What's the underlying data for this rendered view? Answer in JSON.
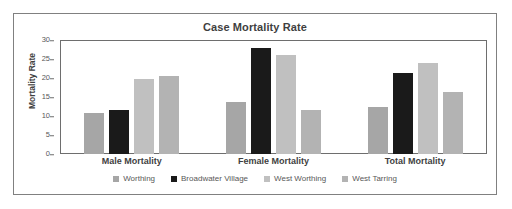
{
  "chart_data": {
    "type": "bar",
    "title": "Case Mortality Rate",
    "xlabel": "",
    "ylabel": "Mortality Rate",
    "categories": [
      "Male Mortality",
      "Female Mortality",
      "Total Mortality"
    ],
    "series": [
      {
        "name": "Worthing",
        "color": "#a6a6a6",
        "values": [
          11.0,
          13.8,
          12.6
        ]
      },
      {
        "name": "Broadwater Village",
        "color": "#1a1a1a",
        "values": [
          11.8,
          28.1,
          21.6
        ]
      },
      {
        "name": "West Worthing",
        "color": "#c0c0c0",
        "values": [
          20.0,
          26.4,
          24.2
        ]
      },
      {
        "name": "West Tarring",
        "color": "#b3b3b3",
        "values": [
          20.7,
          11.7,
          16.5
        ]
      }
    ],
    "ylim": [
      0,
      30
    ],
    "yticks": [
      0,
      5,
      10,
      15,
      20,
      25,
      30
    ],
    "grid": false,
    "legend_position": "bottom"
  }
}
